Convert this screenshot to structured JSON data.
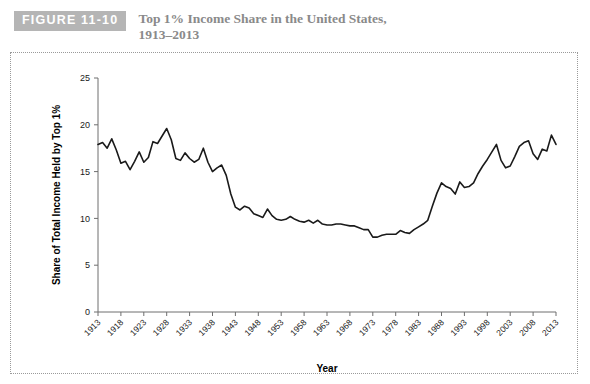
{
  "header": {
    "badge_label": "FIGURE 11-10",
    "title_line1": "Top 1% Income Share in the United States,",
    "title_line2": "1913–2013",
    "badge_bg": "#b5b5b5",
    "title_color": "#8a8a8a"
  },
  "chart_data": {
    "type": "line",
    "title": "Top 1% Income Share in the United States, 1913–2013",
    "xlabel": "Year",
    "ylabel": "Share of Total Income Held by Top 1%",
    "xlim": [
      1913,
      2013
    ],
    "ylim": [
      0,
      25
    ],
    "ytick_step": 5,
    "yticks": [
      0,
      5,
      10,
      15,
      20,
      25
    ],
    "xticks": [
      1913,
      1918,
      1923,
      1928,
      1933,
      1938,
      1943,
      1948,
      1953,
      1958,
      1963,
      1968,
      1973,
      1978,
      1983,
      1988,
      1993,
      1998,
      2003,
      2008,
      2013
    ],
    "grid": false,
    "legend": false,
    "line_color": "#1a1a1a",
    "series": [
      {
        "name": "Top 1% income share",
        "x": [
          1913,
          1914,
          1915,
          1916,
          1917,
          1918,
          1919,
          1920,
          1921,
          1922,
          1923,
          1924,
          1925,
          1926,
          1927,
          1928,
          1929,
          1930,
          1931,
          1932,
          1933,
          1934,
          1935,
          1936,
          1937,
          1938,
          1939,
          1940,
          1941,
          1942,
          1943,
          1944,
          1945,
          1946,
          1947,
          1948,
          1949,
          1950,
          1951,
          1952,
          1953,
          1954,
          1955,
          1956,
          1957,
          1958,
          1959,
          1960,
          1961,
          1962,
          1963,
          1964,
          1965,
          1966,
          1967,
          1968,
          1969,
          1970,
          1971,
          1972,
          1973,
          1974,
          1975,
          1976,
          1977,
          1978,
          1979,
          1980,
          1981,
          1982,
          1983,
          1984,
          1985,
          1986,
          1987,
          1988,
          1989,
          1990,
          1991,
          1992,
          1993,
          1994,
          1995,
          1996,
          1997,
          1998,
          1999,
          2000,
          2001,
          2002,
          2003,
          2004,
          2005,
          2006,
          2007,
          2008,
          2009,
          2010,
          2011,
          2012,
          2013
        ],
        "values": [
          17.9,
          18.1,
          17.5,
          18.5,
          17.3,
          15.9,
          16.1,
          15.2,
          16.1,
          17.1,
          16.0,
          16.5,
          18.2,
          18.0,
          18.8,
          19.6,
          18.4,
          16.4,
          16.2,
          17.0,
          16.4,
          16.0,
          16.3,
          17.5,
          16.0,
          15.0,
          15.4,
          15.7,
          14.6,
          12.6,
          11.2,
          10.9,
          11.3,
          11.1,
          10.5,
          10.3,
          10.1,
          11.0,
          10.3,
          9.9,
          9.8,
          9.9,
          10.2,
          9.9,
          9.7,
          9.6,
          9.8,
          9.5,
          9.8,
          9.4,
          9.3,
          9.3,
          9.4,
          9.4,
          9.3,
          9.2,
          9.2,
          9.0,
          8.8,
          8.8,
          8.0,
          8.0,
          8.2,
          8.3,
          8.3,
          8.3,
          8.7,
          8.5,
          8.4,
          8.8,
          9.1,
          9.4,
          9.8,
          11.3,
          12.7,
          13.8,
          13.4,
          13.2,
          12.6,
          13.9,
          13.3,
          13.4,
          13.8,
          14.8,
          15.6,
          16.3,
          17.1,
          17.9,
          16.2,
          15.4,
          15.6,
          16.6,
          17.7,
          18.1,
          18.3,
          16.9,
          16.3,
          17.4,
          17.2,
          18.9,
          17.9
        ]
      }
    ]
  },
  "axis": {
    "x_title": "Year",
    "y_title": "Share of Total Income Held by Top 1%"
  }
}
